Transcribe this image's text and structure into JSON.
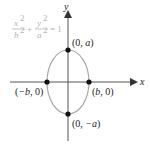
{
  "diagram": {
    "equation": {
      "term1_num": "x",
      "term1_den": "b",
      "term2_num": "y",
      "term2_den": "a",
      "exp": "2",
      "plus": "+",
      "equals": "= 1",
      "color": "#b5b5b5"
    },
    "axes": {
      "x_label": "x",
      "y_label": "y",
      "color": "#555555"
    },
    "ellipse": {
      "color": "#a8a8a8",
      "center": [
        68,
        82
      ],
      "rx": 21,
      "ry": 32
    },
    "points": [
      {
        "name": "top-vertex",
        "label_pre": "(0, ",
        "label_var": "a",
        "label_post": ")"
      },
      {
        "name": "bottom-vertex",
        "label_pre": "(0, ",
        "label_var": "−a",
        "label_post": ")"
      },
      {
        "name": "left-vertex",
        "label_pre": "(",
        "label_var": "−b",
        "label_post": ", 0)"
      },
      {
        "name": "right-vertex",
        "label_pre": "(",
        "label_var": "b",
        "label_post": ", 0)"
      }
    ]
  }
}
